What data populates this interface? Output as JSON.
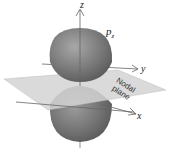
{
  "diagram": {
    "orbital_label": "p",
    "orbital_subscript": "z",
    "axes": {
      "z": "z",
      "y": "y",
      "x": "x"
    },
    "plane_label_line1": "Nodal",
    "plane_label_line2": "plane",
    "colors": {
      "lobe": "#6e6e6e",
      "lobe_highlight": "#9a9a9a",
      "plane": "#d6d6d6",
      "axis": "#555555"
    }
  }
}
